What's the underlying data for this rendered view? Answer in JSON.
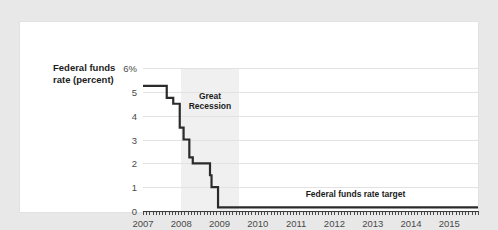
{
  "chart_data": {
    "type": "line",
    "title": "",
    "xlabel": "",
    "ylabel": "Federal funds rate (percent)",
    "ylim": [
      0,
      6
    ],
    "xlim": [
      2007,
      2015.75
    ],
    "grid": true,
    "legend": "none",
    "ytick_labels": [
      "6%",
      "5",
      "4",
      "3",
      "2",
      "1",
      "0"
    ],
    "ytick_values": [
      6,
      5,
      4,
      3,
      2,
      1,
      0
    ],
    "xtick_labels": [
      "2007",
      "2008",
      "2009",
      "2010",
      "2011",
      "2012",
      "2013",
      "2014",
      "2015"
    ],
    "xtick_values": [
      2007,
      2008,
      2009,
      2010,
      2011,
      2012,
      2013,
      2014,
      2015
    ],
    "minor_ticks": "monthly",
    "series": [
      {
        "name": "Federal funds rate target",
        "color": "#2b2b2b",
        "x": [
          2007.0,
          2007.62,
          2007.62,
          2007.79,
          2007.79,
          2007.96,
          2007.96,
          2008.06,
          2008.06,
          2008.21,
          2008.21,
          2008.3,
          2008.3,
          2008.38,
          2008.38,
          2008.75,
          2008.75,
          2008.79,
          2008.79,
          2008.96,
          2008.96,
          2015.75
        ],
        "y": [
          5.25,
          5.25,
          4.75,
          4.75,
          4.5,
          4.5,
          3.5,
          3.5,
          3.0,
          3.0,
          2.25,
          2.25,
          2.0,
          2.0,
          2.0,
          2.0,
          1.5,
          1.5,
          1.0,
          1.0,
          0.15,
          0.15
        ]
      }
    ],
    "annotations": [
      {
        "name": "recession-band",
        "type": "vspan",
        "x_start": 2008.0,
        "x_end": 2009.5,
        "color": "#f0f0f0",
        "label_line1": "Great",
        "label_line2": "Recession"
      },
      {
        "name": "target-line-label",
        "type": "text",
        "text": "Federal funds rate target",
        "x": 2012.55,
        "y": 0.72
      }
    ]
  },
  "axis_title": {
    "line1": "Federal funds",
    "line2": "rate (percent)"
  },
  "recession": {
    "line1": "Great",
    "line2": "Recession"
  },
  "target": {
    "label": "Federal funds rate target"
  }
}
